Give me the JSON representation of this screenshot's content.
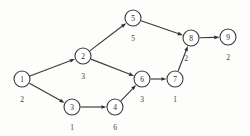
{
  "diagram": {
    "type": "directed-graph",
    "title": "",
    "background_color": "#fdfdfc",
    "node_stroke_color": "#3a3a3a",
    "node_fill_color": "#ffffff",
    "edge_color": "#3a3a3a",
    "text_color": "#2b2b2b",
    "node_radius": 8,
    "nodes": [
      {
        "id": "1",
        "label": "1",
        "weight": "2",
        "cx": 22,
        "cy": 79,
        "wx": 22,
        "wy": 99
      },
      {
        "id": "2",
        "label": "2",
        "weight": "3",
        "cx": 83,
        "cy": 56,
        "wx": 83,
        "wy": 76
      },
      {
        "id": "3",
        "label": "3",
        "weight": "1",
        "cx": 72,
        "cy": 107,
        "wx": 72,
        "wy": 127
      },
      {
        "id": "4",
        "label": "4",
        "weight": "6",
        "cx": 115,
        "cy": 107,
        "wx": 115,
        "wy": 127
      },
      {
        "id": "5",
        "label": "5",
        "weight": "5",
        "cx": 133,
        "cy": 18,
        "wx": 133,
        "wy": 38
      },
      {
        "id": "6",
        "label": "6",
        "weight": "3",
        "cx": 142,
        "cy": 79,
        "wx": 142,
        "wy": 99
      },
      {
        "id": "7",
        "label": "7",
        "weight": "1",
        "cx": 175,
        "cy": 79,
        "wx": 175,
        "wy": 99
      },
      {
        "id": "8",
        "label": "8",
        "weight": "2",
        "cx": 191,
        "cy": 38,
        "wx": 186,
        "wy": 58
      },
      {
        "id": "9",
        "label": "9",
        "weight": "2",
        "cx": 228,
        "cy": 37,
        "wx": 228,
        "wy": 57
      }
    ],
    "edges": [
      {
        "from": "1",
        "to": "2",
        "directed": true
      },
      {
        "from": "1",
        "to": "3",
        "directed": true
      },
      {
        "from": "2",
        "to": "5",
        "directed": true
      },
      {
        "from": "2",
        "to": "6",
        "directed": true
      },
      {
        "from": "3",
        "to": "4",
        "directed": true
      },
      {
        "from": "4",
        "to": "6",
        "directed": true
      },
      {
        "from": "5",
        "to": "8",
        "directed": true
      },
      {
        "from": "6",
        "to": "7",
        "directed": true
      },
      {
        "from": "7",
        "to": "8",
        "directed": true
      },
      {
        "from": "8",
        "to": "9",
        "directed": true
      }
    ]
  }
}
